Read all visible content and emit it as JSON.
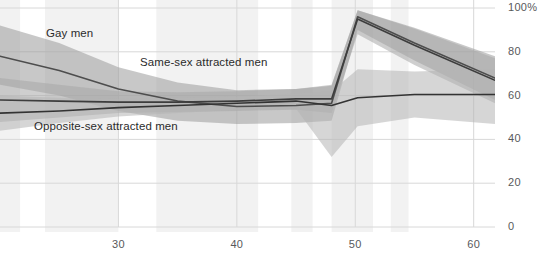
{
  "chart_data": {
    "type": "line",
    "title": "",
    "subtitle": "",
    "xlabel": "",
    "ylabel": "",
    "xlim": [
      20.0,
      61.8
    ],
    "ylim": [
      0,
      100
    ],
    "ytick_values": [
      0,
      20,
      40,
      60,
      80,
      100
    ],
    "ytick_labels": [
      "0",
      "20",
      "40",
      "60",
      "80",
      "100%"
    ],
    "xtick_values": [
      30,
      40,
      50,
      60
    ],
    "xtick_labels": [
      "30",
      "40",
      "50",
      "60"
    ],
    "grid": true,
    "legend_position": "inline-annotations",
    "band_fill_note": "shaded confidence ribbons around each line",
    "vertical_bands": [
      {
        "x0": 20.0,
        "x1": 21.7
      },
      {
        "x0": 23.8,
        "x1": 30.0
      },
      {
        "x0": 33.2,
        "x1": 41.8
      },
      {
        "x0": 44.6,
        "x1": 46.4
      },
      {
        "x0": 48.0,
        "x1": 51.5
      },
      {
        "x0": 53.0,
        "x1": 54.5
      }
    ],
    "series": [
      {
        "name": "Gay men",
        "color": "#4d4d4d",
        "band_color": "#9a9a9a",
        "x": [
          20.0,
          25.0,
          30.0,
          35.0,
          40.0,
          45.0,
          48.0,
          50.2,
          55.0,
          61.8
        ],
        "values": [
          78.0,
          71.5,
          63.0,
          57.5,
          55.0,
          55.5,
          56.5,
          96.0,
          84.0,
          68.0
        ],
        "lower": [
          65.0,
          60.0,
          53.0,
          48.5,
          47.0,
          47.5,
          48.5,
          90.0,
          76.0,
          58.0
        ],
        "upper": [
          92.0,
          84.0,
          73.0,
          66.0,
          62.5,
          63.0,
          64.5,
          99.0,
          91.0,
          78.0
        ]
      },
      {
        "name": "Same-sex attracted men",
        "color": "#3d3d3d",
        "band_color": "#a8a8a8",
        "x": [
          20.0,
          25.0,
          30.0,
          35.0,
          40.0,
          45.0,
          48.0,
          50.2,
          55.0,
          61.8
        ],
        "values": [
          58.0,
          57.5,
          57.0,
          57.0,
          57.5,
          58.5,
          58.5,
          95.0,
          83.0,
          67.0
        ],
        "lower": [
          48.0,
          50.0,
          52.0,
          52.5,
          53.0,
          53.5,
          52.0,
          88.0,
          74.0,
          56.5
        ],
        "upper": [
          68.0,
          65.0,
          62.0,
          61.5,
          62.0,
          63.0,
          65.0,
          99.0,
          90.5,
          77.0
        ]
      },
      {
        "name": "Opposite-sex attracted men",
        "color": "#333333",
        "band_color": "#b5b5b5",
        "x": [
          20.0,
          25.0,
          30.0,
          35.0,
          40.0,
          45.0,
          48.0,
          50.2,
          55.0,
          61.8
        ],
        "values": [
          52.0,
          53.0,
          54.5,
          55.5,
          56.5,
          57.5,
          55.5,
          59.0,
          60.5,
          60.5
        ],
        "lower": [
          44.0,
          47.5,
          50.5,
          52.0,
          53.5,
          54.0,
          32.0,
          46.0,
          50.0,
          47.0
        ],
        "upper": [
          60.0,
          59.0,
          58.5,
          59.0,
          59.5,
          61.0,
          62.0,
          72.0,
          71.0,
          72.0
        ]
      }
    ],
    "annotations": [
      {
        "text": "Gay men",
        "x_px": 46,
        "y_px": 27
      },
      {
        "text": "Same-sex attracted men",
        "x_px": 140,
        "y_px": 56
      },
      {
        "text": "Opposite-sex attracted men",
        "x_px": 34,
        "y_px": 120
      }
    ]
  }
}
